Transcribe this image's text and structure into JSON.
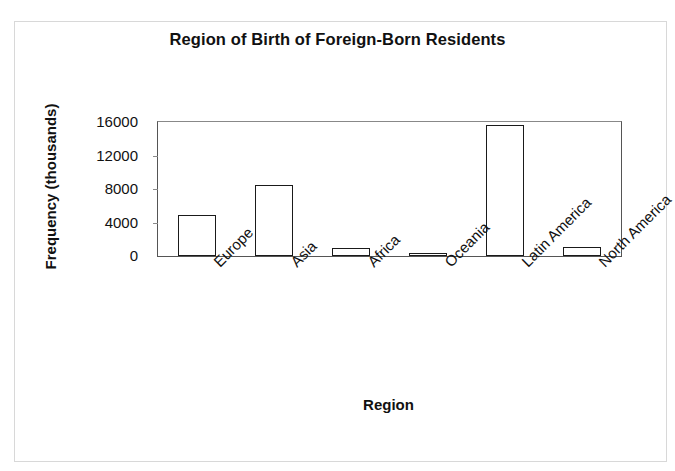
{
  "chart_data": {
    "type": "bar",
    "title": "Region of Birth of Foreign-Born Residents",
    "xlabel": "Region",
    "ylabel": "Frequency (thousands)",
    "categories": [
      "Europe",
      "Asia",
      "Africa",
      "Oceania",
      "Latin America",
      "North America"
    ],
    "values": [
      4900,
      8500,
      950,
      200,
      15600,
      1100
    ],
    "yticks": [
      0,
      4000,
      8000,
      12000,
      16000
    ],
    "ytick_labels": [
      "0",
      "4000",
      "8000",
      "12000",
      "16000"
    ],
    "ylim": [
      0,
      16000
    ],
    "grid": false,
    "legend": null,
    "bar_style": {
      "fill": "#ffffff",
      "edge": "#1a1a1a"
    }
  },
  "figure": {
    "background": "#ffffff",
    "border_color": "#d8d8d8",
    "text_color": "#111111"
  }
}
